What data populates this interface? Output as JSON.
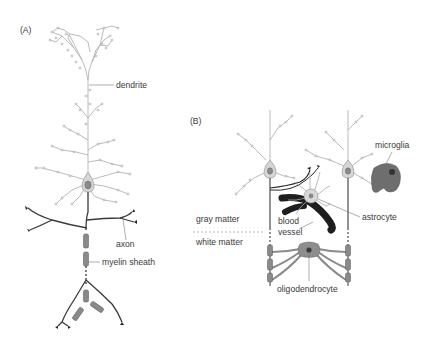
{
  "figure": {
    "panel_a": {
      "label": "(A)",
      "labels": {
        "dendrite": "dendrite",
        "axon": "axon",
        "myelin_sheath": "myelin sheath"
      }
    },
    "panel_b": {
      "label": "(B)",
      "labels": {
        "microglia": "microglia",
        "astrocyte": "astrocyte",
        "blood_vessel_line1": "blood",
        "blood_vessel_line2": "vessel",
        "gray_matter": "gray matter",
        "white_matter": "white matter",
        "oligodendrocyte": "oligodendrocyte"
      }
    },
    "colors": {
      "dendrite": "#a9a9a9",
      "axon": "#3a3a3a",
      "myelin": "#8a8a8a",
      "soma": "#d6d6d6",
      "nucleus": "#8b8b8b",
      "blood_vessel": "#1e1e1e",
      "microglia": "#6e6e6e",
      "text": "#3a3a3a"
    }
  }
}
